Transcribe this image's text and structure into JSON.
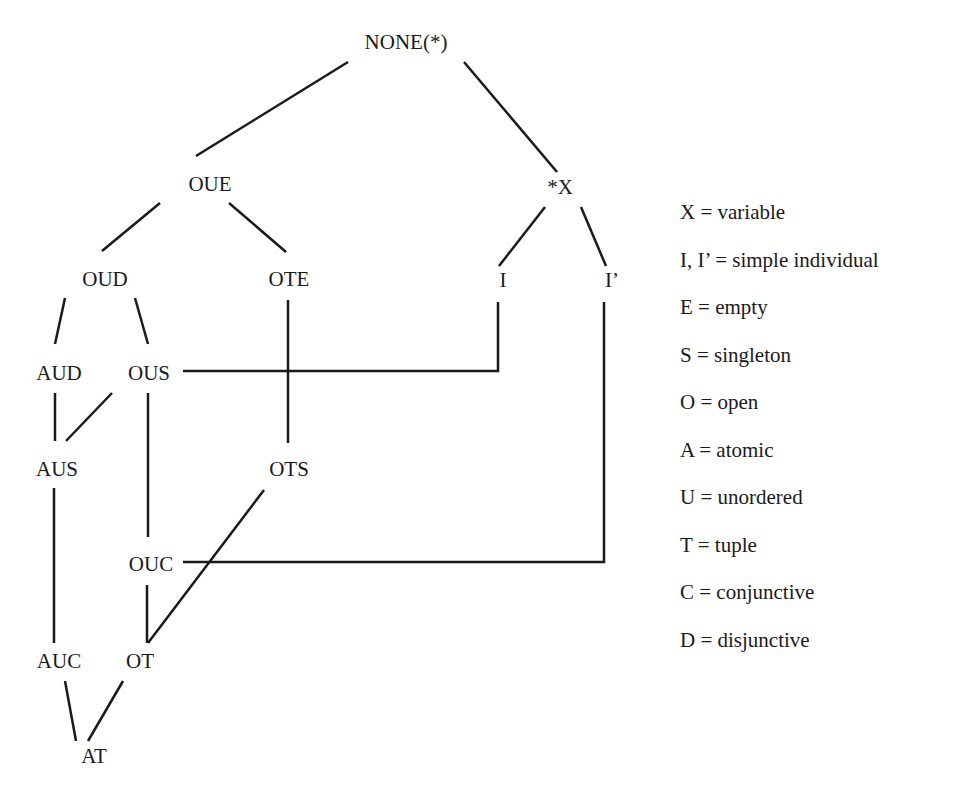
{
  "diagram": {
    "type": "lattice",
    "line_color": "#1a1a1a",
    "line_width": 2.5,
    "nodes": [
      {
        "id": "NONE",
        "label": "NONE(*)",
        "x": 406,
        "y": 42
      },
      {
        "id": "OUE",
        "label": "OUE",
        "x": 210,
        "y": 184
      },
      {
        "id": "X",
        "label": "*X",
        "x": 560,
        "y": 187
      },
      {
        "id": "OUD",
        "label": "OUD",
        "x": 105,
        "y": 279
      },
      {
        "id": "OTE",
        "label": "OTE",
        "x": 289,
        "y": 279
      },
      {
        "id": "I",
        "label": "I",
        "x": 503,
        "y": 280
      },
      {
        "id": "Iprime",
        "label": "I’",
        "x": 612,
        "y": 280
      },
      {
        "id": "AUD",
        "label": "AUD",
        "x": 59,
        "y": 373
      },
      {
        "id": "OUS",
        "label": "OUS",
        "x": 149,
        "y": 373
      },
      {
        "id": "AUS",
        "label": "AUS",
        "x": 57,
        "y": 469
      },
      {
        "id": "OTS",
        "label": "OTS",
        "x": 289,
        "y": 469
      },
      {
        "id": "OUC",
        "label": "OUC",
        "x": 151,
        "y": 564
      },
      {
        "id": "AUC",
        "label": "AUC",
        "x": 59,
        "y": 661
      },
      {
        "id": "OT",
        "label": "OT",
        "x": 140,
        "y": 661
      },
      {
        "id": "AT",
        "label": "AT",
        "x": 94,
        "y": 756
      }
    ],
    "edges": [
      {
        "from": "NONE",
        "to": "OUE",
        "points": [
          [
            348,
            62
          ],
          [
            196,
            156
          ]
        ]
      },
      {
        "from": "NONE",
        "to": "X",
        "points": [
          [
            464,
            62
          ],
          [
            557,
            172
          ]
        ]
      },
      {
        "from": "OUE",
        "to": "OUD",
        "points": [
          [
            160,
            203
          ],
          [
            102,
            251
          ]
        ]
      },
      {
        "from": "OUE",
        "to": "OTE",
        "points": [
          [
            229,
            203
          ],
          [
            286,
            252
          ]
        ]
      },
      {
        "from": "X",
        "to": "I",
        "points": [
          [
            545,
            207
          ],
          [
            499,
            266
          ]
        ]
      },
      {
        "from": "X",
        "to": "Iprime",
        "points": [
          [
            581,
            207
          ],
          [
            606,
            266
          ]
        ]
      },
      {
        "from": "OUD",
        "to": "AUD",
        "points": [
          [
            65,
            298
          ],
          [
            55,
            344
          ]
        ]
      },
      {
        "from": "OUD",
        "to": "OUS",
        "points": [
          [
            135,
            298
          ],
          [
            148,
            344
          ]
        ]
      },
      {
        "from": "I",
        "to": "OUS",
        "points": [
          [
            498,
            302
          ],
          [
            498,
            371
          ],
          [
            183,
            371
          ]
        ]
      },
      {
        "from": "OTE",
        "to": "OTS",
        "points": [
          [
            288,
            300
          ],
          [
            288,
            443
          ]
        ]
      },
      {
        "from": "AUD",
        "to": "AUS",
        "points": [
          [
            55,
            393
          ],
          [
            55,
            441
          ]
        ]
      },
      {
        "from": "OUS",
        "to": "AUS",
        "points": [
          [
            112,
            393
          ],
          [
            66,
            441
          ]
        ]
      },
      {
        "from": "OUS",
        "to": "OUC",
        "points": [
          [
            148,
            393
          ],
          [
            148,
            537
          ]
        ]
      },
      {
        "from": "Iprime",
        "to": "OUC",
        "points": [
          [
            604,
            302
          ],
          [
            604,
            562
          ],
          [
            183,
            562
          ]
        ]
      },
      {
        "from": "AUS",
        "to": "AUC",
        "points": [
          [
            54,
            488
          ],
          [
            54,
            643
          ]
        ]
      },
      {
        "from": "OTS",
        "to": "OT",
        "points": [
          [
            264,
            490
          ],
          [
            148,
            643
          ]
        ]
      },
      {
        "from": "OUC",
        "to": "OT",
        "points": [
          [
            147,
            585
          ],
          [
            147,
            643
          ]
        ]
      },
      {
        "from": "AUC",
        "to": "AT",
        "points": [
          [
            65,
            681
          ],
          [
            76,
            741
          ]
        ]
      },
      {
        "from": "OT",
        "to": "AT",
        "points": [
          [
            123,
            681
          ],
          [
            88,
            741
          ]
        ]
      }
    ]
  },
  "legend": {
    "items": [
      {
        "key": "X",
        "text": "X = variable"
      },
      {
        "key": "I",
        "text": "I, I’ = simple individual"
      },
      {
        "key": "E",
        "text": "E = empty"
      },
      {
        "key": "S",
        "text": "S = singleton"
      },
      {
        "key": "O",
        "text": "O = open"
      },
      {
        "key": "A",
        "text": "A = atomic"
      },
      {
        "key": "U",
        "text": "U = unordered"
      },
      {
        "key": "T",
        "text": "T = tuple"
      },
      {
        "key": "C",
        "text": "C = conjunctive"
      },
      {
        "key": "D",
        "text": "D = disjunctive"
      }
    ]
  }
}
